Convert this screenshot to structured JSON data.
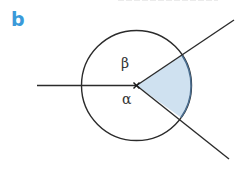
{
  "figure": {
    "part_label": "b",
    "part_label_color": "#3a9ad9",
    "angle_labels": {
      "upper": "β",
      "lower": "α"
    },
    "colors": {
      "line": "#2b2b2b",
      "sector_fill": "#cfe1f0",
      "sector_arc": "#4b6e90"
    },
    "geometry": {
      "center": [
        136.5,
        85.5
      ],
      "radius": 55,
      "horizontal_ray_start": [
        37,
        85.5
      ],
      "upper_ray_end": [
        234,
        20
      ],
      "lower_ray_end": [
        229,
        159
      ]
    }
  }
}
